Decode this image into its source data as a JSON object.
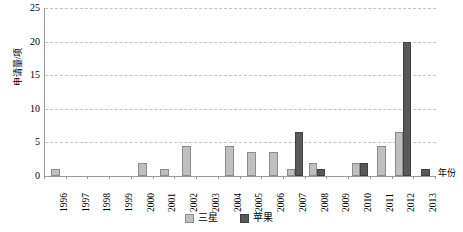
{
  "chart_data": {
    "type": "bar",
    "title": "",
    "subtitle": "",
    "xlabel": "年份",
    "ylabel": "申请量/项",
    "ylim": [
      0,
      25
    ],
    "yticks": [
      0,
      5,
      10,
      15,
      20,
      25
    ],
    "grid": true,
    "legend_position": "bottom",
    "categories": [
      "1996",
      "1997",
      "1998",
      "1999",
      "2000",
      "2001",
      "2002",
      "2003",
      "2004",
      "2005",
      "2006",
      "2007",
      "2008",
      "2009",
      "2010",
      "2011",
      "2012",
      "2013"
    ],
    "series": [
      {
        "name": "三星",
        "color": "#bfbfbf",
        "values": [
          1,
          0,
          0,
          0,
          2,
          1,
          4.5,
          0,
          4.5,
          3.5,
          3.5,
          1,
          2,
          0,
          2,
          4.5,
          6.5,
          0
        ]
      },
      {
        "name": "苹果",
        "color": "#595959",
        "values": [
          0,
          0,
          0,
          0,
          0,
          0,
          0,
          0,
          0,
          0,
          0,
          6.5,
          1,
          0,
          2,
          0,
          20,
          1
        ]
      }
    ]
  },
  "legend": {
    "items": [
      {
        "label": "三星",
        "swatch": "samsung"
      },
      {
        "label": "苹果",
        "swatch": "apple"
      }
    ]
  },
  "axis": {
    "y_title": "申请量/项",
    "x_title": "年份",
    "y_tick_labels": [
      "25",
      "20",
      "15",
      "10",
      "5",
      "0"
    ],
    "x_tick_labels": [
      "1996",
      "1997",
      "1998",
      "1999",
      "2000",
      "2001",
      "2002",
      "2003",
      "2004",
      "2005",
      "2006",
      "2007",
      "2008",
      "2009",
      "2010",
      "2011",
      "2012",
      "2013"
    ]
  }
}
